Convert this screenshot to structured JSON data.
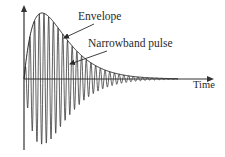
{
  "diagram": {
    "title": "",
    "labels": {
      "envelope": "Envelope",
      "pulse": "Narrowband pulse",
      "x_axis": "Time"
    },
    "colors": {
      "stroke": "#2a2a2a",
      "axis": "#333333",
      "background": "#ffffff"
    },
    "geometry": {
      "origin_x": 24,
      "axis_y": 79,
      "y_axis_top": 5,
      "y_axis_bottom": 150,
      "x_axis_end": 214,
      "peak_t": 18,
      "peak_amplitude": 66,
      "carrier_period": 4.7,
      "pulse_end_x": 178
    },
    "arrows": [
      {
        "name": "envelope-arrow",
        "from": [
          94,
          24
        ],
        "to": [
          64,
          38
        ]
      },
      {
        "name": "pulse-arrow",
        "from": [
          107,
          51
        ],
        "to": [
          70,
          64
        ]
      }
    ]
  }
}
